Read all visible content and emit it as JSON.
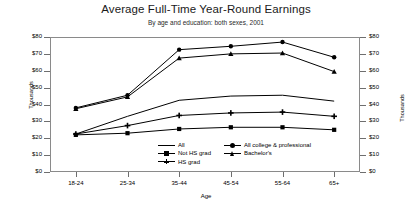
{
  "chart_data": {
    "type": "line",
    "title": "Average Full-Time Year-Round Earnings",
    "subtitle": "By age and education: both sexes, 2001",
    "xlabel": "Age",
    "ylabel": "Thousands",
    "ylabel_right": "Thousands",
    "categories": [
      "18-24",
      "25-34",
      "35-44",
      "45-54",
      "55-64",
      "65+"
    ],
    "ylim": [
      0,
      80
    ],
    "ytick_labels": [
      "$80",
      "$70",
      "$60",
      "$50",
      "$40",
      "$30",
      "$20",
      "$10",
      "$0"
    ],
    "ytick_values": [
      80,
      70,
      60,
      50,
      40,
      30,
      20,
      10,
      0
    ],
    "grid": false,
    "legend_position": "inside-bottom-center",
    "series": [
      {
        "name": "All",
        "marker": "line",
        "values": [
          22.5,
          33.0,
          42.5,
          45.0,
          45.5,
          42.0
        ]
      },
      {
        "name": "Not HS grad",
        "marker": "square",
        "values": [
          22.0,
          23.0,
          25.5,
          26.5,
          26.5,
          25.0
        ]
      },
      {
        "name": "HS grad",
        "marker": "plus",
        "values": [
          22.5,
          27.5,
          33.5,
          35.0,
          35.5,
          33.0
        ]
      },
      {
        "name": "All college & professional",
        "marker": "dot",
        "values": [
          38.0,
          45.5,
          72.5,
          74.5,
          77.0,
          68.0
        ]
      },
      {
        "name": "Bachelor's",
        "marker": "triangle",
        "values": [
          37.5,
          44.5,
          67.5,
          70.0,
          70.5,
          59.5
        ]
      }
    ]
  },
  "legend": {
    "column_1": [
      "All",
      "Not HS grad",
      "HS grad"
    ],
    "column_2": [
      "All college & professional",
      "Bachelor's"
    ]
  },
  "axes": {
    "x_ticks": [
      "18-24",
      "25-34",
      "35-44",
      "45-54",
      "55-64",
      "65+"
    ],
    "y_ticks_left": [
      "$80",
      "$70",
      "$60",
      "$50",
      "$40",
      "$30",
      "$20",
      "$10",
      "$0"
    ],
    "y_ticks_right": [
      "$80",
      "$70",
      "$60",
      "$50",
      "$40",
      "$30",
      "$20",
      "$10",
      "$0"
    ]
  }
}
